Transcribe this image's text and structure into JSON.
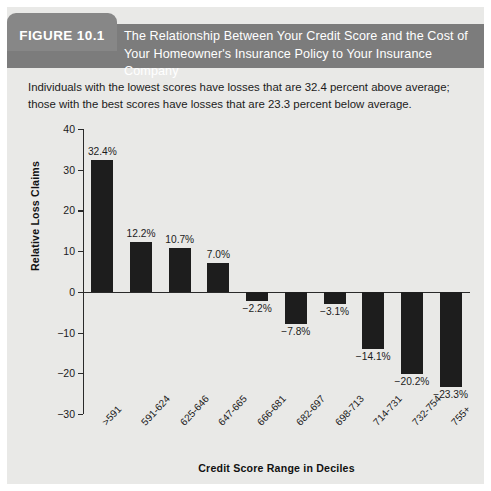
{
  "figure": {
    "tab_label": "FIGURE 10.1",
    "title": "The Relationship Between Your Credit Score and the Cost of Your Homeowner's Insurance Policy to Your Insurance Company",
    "description": "Individuals with the lowest scores have losses that are 32.4 percent above average; those with the best scores have losses that are 23.3 percent below average.",
    "tab_color": "#878787",
    "header_color": "#7c7c7c",
    "panel_color": "#e9e9e7",
    "bar_color": "#1d1d1d"
  },
  "chart_data": {
    "type": "bar",
    "title": "",
    "xlabel": "Credit Score Range in Deciles",
    "ylabel": "Relative Loss Claims",
    "categories": [
      ">591",
      "591-624",
      "625-646",
      "647-665",
      "666-681",
      "682-697",
      "698-713",
      "714-731",
      "732-754",
      "755+"
    ],
    "values": [
      32.4,
      12.2,
      10.7,
      7.0,
      -2.2,
      -7.8,
      -3.1,
      -14.1,
      -20.2,
      -23.3
    ],
    "point_labels": [
      "32.4%",
      "12.2%",
      "10.7%",
      "7.0%",
      "-2.2%",
      "-7.8%",
      "-3.1%",
      "-14.1%",
      "-20.2%",
      "-23.3%"
    ],
    "ylim": [
      -30,
      40
    ],
    "yticks": [
      40,
      30,
      20,
      10,
      0,
      -10,
      -20,
      -30
    ],
    "ytick_labels": [
      "40",
      "30",
      "20",
      "10",
      "0",
      "-10",
      "-20",
      "-30"
    ],
    "grid": false,
    "legend": "none"
  }
}
